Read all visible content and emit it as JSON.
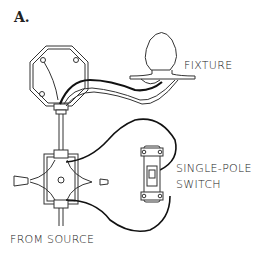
{
  "panel": {
    "label": "A."
  },
  "labels": {
    "fixture": "FIXTURE",
    "switch_line1": "SINGLE-POLE",
    "switch_line2": "SWITCH",
    "source": "FROM SOURCE"
  },
  "colors": {
    "stroke": "#333333",
    "wire_black": "#111111",
    "background": "#ffffff"
  }
}
